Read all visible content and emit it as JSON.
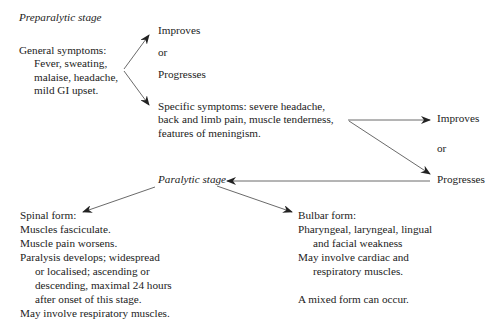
{
  "preparalytic": {
    "title": "Preparalytic stage",
    "general": {
      "heading": "General symptoms:",
      "lines": [
        "Fever, sweating,",
        "malaise, headache,",
        "mild GI upset."
      ]
    },
    "outcome1": {
      "improves": "Improves",
      "or": "or",
      "progresses": "Progresses"
    },
    "specific": {
      "lines": [
        "Specific symptoms: severe headache,",
        "back and limb pain, muscle tenderness,",
        "features of meningism."
      ]
    },
    "outcome2": {
      "improves": "Improves",
      "or": "or",
      "progresses": "Progresses"
    }
  },
  "paralytic": {
    "title": "Paralytic stage",
    "spinal": {
      "heading": "Spinal form:",
      "lines": [
        "Muscles fasciculate.",
        "Muscle pain worsens.",
        "Paralysis develops; widespread"
      ],
      "indented": [
        "or localised; ascending or",
        "descending, maximal 24 hours",
        "after onset of this stage."
      ],
      "last": "May involve respiratory muscles."
    },
    "bulbar": {
      "heading": "Bulbar form:",
      "line1": "Pharyngeal, laryngeal, lingual",
      "line1_indent": "and facial weakness",
      "line2": "May involve cardiac and",
      "line2_indent": "respiratory muscles.",
      "mixed": "A mixed form can occur."
    }
  }
}
